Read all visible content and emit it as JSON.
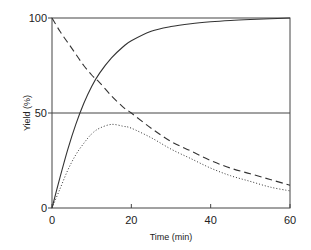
{
  "chart_data": {
    "type": "line",
    "title": "",
    "xlabel": "Time (min)",
    "ylabel": "Yield (%)",
    "xlim": [
      0,
      60
    ],
    "ylim": [
      0,
      100
    ],
    "x_ticks": [
      0,
      20,
      40,
      60
    ],
    "y_ticks": [
      0,
      50,
      100
    ],
    "reference_lines": [
      {
        "axis": "y",
        "value": 50
      }
    ],
    "grid": false,
    "legend": null,
    "x": [
      0,
      2,
      4,
      6,
      8,
      10,
      12,
      15,
      18,
      20,
      25,
      30,
      35,
      40,
      45,
      50,
      55,
      60
    ],
    "series": [
      {
        "name": "solid",
        "style": "solid",
        "values": [
          0,
          16,
          31,
          44,
          55,
          64,
          71,
          79,
          85,
          88,
          93,
          95.5,
          97,
          98,
          98.7,
          99.2,
          99.6,
          100
        ]
      },
      {
        "name": "dashed",
        "style": "dashed",
        "values": [
          100,
          93,
          87,
          81,
          75,
          70,
          66,
          59,
          53,
          50,
          42,
          35,
          30,
          25,
          21,
          18,
          15,
          12
        ]
      },
      {
        "name": "dotted",
        "style": "dotted",
        "values": [
          0,
          10,
          20,
          28,
          34,
          39,
          42,
          44,
          43,
          42,
          37,
          31,
          26,
          21,
          17,
          14,
          11,
          9
        ]
      }
    ]
  },
  "axes": {
    "x_title": "Time (min)",
    "y_title": "Yield (%)",
    "x_tick_labels": [
      "0",
      "20",
      "40",
      "60"
    ],
    "y_tick_labels": [
      "0",
      "50",
      "100"
    ]
  }
}
